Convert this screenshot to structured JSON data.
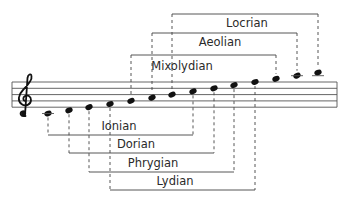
{
  "colors": {
    "background": "#ffffff",
    "ink": "#111111",
    "line": "#444444",
    "text": "#2a2a2a"
  },
  "staff": {
    "clef": "treble-clef",
    "left": 12,
    "right": 337,
    "lines_y": [
      82,
      88.3,
      94.6,
      100.9,
      107.2
    ]
  },
  "notes": [
    {
      "name": "C4",
      "x": 48,
      "y": 113.5
    },
    {
      "name": "D4",
      "x": 69,
      "y": 110.3
    },
    {
      "name": "E4",
      "x": 89,
      "y": 107.2
    },
    {
      "name": "F4",
      "x": 110,
      "y": 104
    },
    {
      "name": "G4",
      "x": 131,
      "y": 100.9
    },
    {
      "name": "A4",
      "x": 152,
      "y": 97.7
    },
    {
      "name": "B4",
      "x": 172,
      "y": 94.6
    },
    {
      "name": "C5",
      "x": 193,
      "y": 91.4
    },
    {
      "name": "D5",
      "x": 214,
      "y": 88.3
    },
    {
      "name": "E5",
      "x": 234,
      "y": 85.1
    },
    {
      "name": "F5",
      "x": 255,
      "y": 82
    },
    {
      "name": "G5",
      "x": 276,
      "y": 78.8
    },
    {
      "name": "A5",
      "x": 297,
      "y": 75.7
    },
    {
      "name": "B5",
      "x": 318,
      "y": 72.5
    }
  ],
  "modes_above": [
    {
      "label": "Locrian",
      "x1": 172,
      "x2": 318,
      "bar_y": 14,
      "label_x": 247,
      "label_y": 27
    },
    {
      "label": "Aeolian",
      "x1": 152,
      "x2": 297,
      "bar_y": 33,
      "label_x": 220,
      "label_y": 46
    },
    {
      "label": "Mixolydian",
      "x1": 131,
      "x2": 276,
      "bar_y": 55,
      "label_x": 182,
      "label_y": 70
    }
  ],
  "modes_below": [
    {
      "label": "Ionian",
      "x1": 48,
      "x2": 193,
      "bar_y": 135,
      "label_x": 119,
      "label_y": 130
    },
    {
      "label": "Dorian",
      "x1": 69,
      "x2": 214,
      "bar_y": 153,
      "label_x": 136,
      "label_y": 148
    },
    {
      "label": "Phrygian",
      "x1": 89,
      "x2": 234,
      "bar_y": 172,
      "label_x": 153,
      "label_y": 167
    },
    {
      "label": "Lydian",
      "x1": 110,
      "x2": 255,
      "bar_y": 190,
      "label_x": 175,
      "label_y": 185
    }
  ]
}
